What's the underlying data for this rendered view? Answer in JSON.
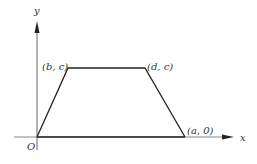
{
  "diagram": {
    "type": "trapezoid-function-graph",
    "axes": {
      "x_label": "x",
      "y_label": "y",
      "origin_label": "O"
    },
    "points": [
      {
        "id": "origin",
        "label": ""
      },
      {
        "id": "bc",
        "label": "(b, c)"
      },
      {
        "id": "dc",
        "label": "(d, c)"
      },
      {
        "id": "a0",
        "label": "(a, 0)"
      }
    ],
    "colors": {
      "line": "#222222",
      "axis": "#555555",
      "text": "#333333"
    }
  }
}
